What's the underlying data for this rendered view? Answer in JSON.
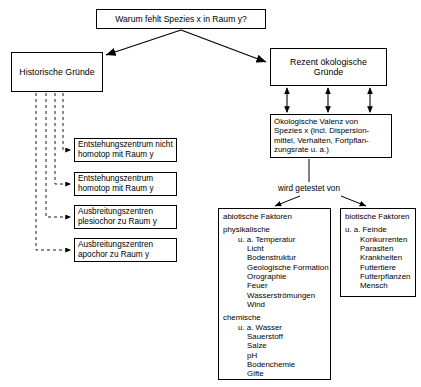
{
  "diagram": {
    "question": "Warum fehlt Spezies x in Raum y?",
    "historical": {
      "title": "Historische Gründe",
      "items": [
        {
          "line1": "Entstehungszentrum nicht",
          "line2": "homotop mit Raum y"
        },
        {
          "line1": "Entstehungszentrum",
          "line2": "homotop mit Raum y"
        },
        {
          "line1": "Ausbreitungszentren",
          "line2": "plesiochor zu Raum y"
        },
        {
          "line1": "Ausbreitungszentren",
          "line2": "apochor zu Raum y"
        }
      ]
    },
    "recent": {
      "title_line1": "Rezent ökologische",
      "title_line2": "Gründe"
    },
    "valence": {
      "line1": "Ökologische Valenz von",
      "line2": "Spezies x (incl. Dispersion-",
      "line3": "mittel, Verhalten, Fortpflan-",
      "line4": "zungsrate u. a.)"
    },
    "tested_by": "wird getestet von",
    "abiotic": {
      "title": "abiotische Faktoren",
      "group1_label": "physikalische",
      "group1_lead": "u. a. Temperatur",
      "group1_items": [
        "Licht",
        "Bodenstruktur",
        "Geologische Formation",
        "Orographie",
        "Feuer",
        "Wasserströmungen",
        "Wind"
      ],
      "group2_label": "chemische",
      "group2_lead": "u. a. Wasser",
      "group2_items": [
        "Sauerstoff",
        "Salze",
        "pH",
        "Bodenchemie",
        "Gifte"
      ]
    },
    "biotic": {
      "title": "biotische Faktoren",
      "lead": "u. a. Feinde",
      "items": [
        "Konkurrenten",
        "Parasiten",
        "Krankheiten",
        "Futtertiere",
        "Futterpflanzen",
        "Mensch"
      ]
    }
  }
}
